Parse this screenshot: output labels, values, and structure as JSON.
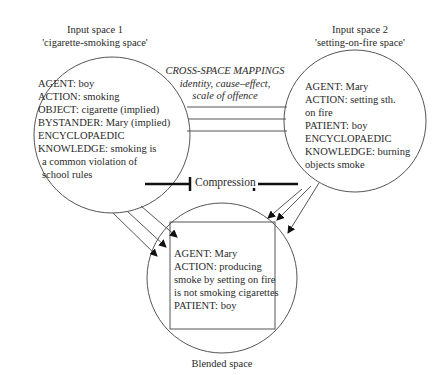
{
  "input_space_1": {
    "title": "Input space 1",
    "subtitle": "'cigarette-smoking space'",
    "lines": [
      "AGENT: boy",
      "ACTION: smoking",
      "OBJECT: cigarette (implied)",
      "BYSTANDER: Mary (implied)",
      "ENCYCLOPAEDIC",
      "KNOWLEDGE: smoking is",
      "  a common violation of",
      "  school rules"
    ]
  },
  "input_space_2": {
    "title": "Input space 2",
    "subtitle": "'setting-on-fire space'",
    "lines": [
      "AGENT: Mary",
      "ACTION: setting sth.",
      "on fire",
      "PATIENT: boy",
      "ENCYCLOPAEDIC",
      "KNOWLEDGE: burning",
      "objects smoke"
    ]
  },
  "cross_space": {
    "title": "CROSS-SPACE MAPPINGS",
    "line2": "identity, cause–effect,",
    "line3": "scale of offence"
  },
  "compression": {
    "label": "Compression"
  },
  "blended_space": {
    "title": "Blended space",
    "lines": [
      "AGENT: Mary",
      "ACTION: producing",
      "smoke by setting on fire",
      "is not smoking cigarettes",
      "PATIENT: boy"
    ]
  },
  "colors": {
    "line": "#555555",
    "text": "#2a2a2a",
    "bar": "#111111"
  }
}
